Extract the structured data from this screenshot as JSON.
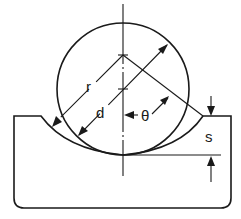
{
  "diagram": {
    "labels": {
      "r": "r",
      "d": "d",
      "theta": "θ",
      "s": "s"
    },
    "elements": [
      {
        "name": "ball",
        "shape": "circle"
      },
      {
        "name": "groove-block",
        "shape": "block with curved groove"
      },
      {
        "name": "groove-radius",
        "label": "r"
      },
      {
        "name": "ball-diameter",
        "label": "d"
      },
      {
        "name": "contact-angle",
        "label": "θ"
      },
      {
        "name": "groove-depth",
        "label": "s"
      }
    ],
    "colors": {
      "line": "#1a1a1a",
      "background": "#ffffff"
    }
  }
}
